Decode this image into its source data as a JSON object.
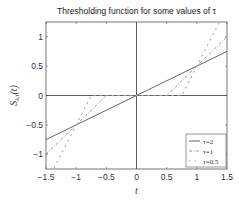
{
  "chart_data": {
    "type": "line",
    "title": "Thresholding function for some values of τ",
    "xlabel": "t",
    "ylabel": "S_{λ,τ}(t)",
    "xlim": [
      -1.5,
      1.5
    ],
    "ylim": [
      -1.25,
      1.25
    ],
    "xticks": [
      -1.5,
      -1,
      -0.5,
      0,
      0.5,
      1,
      1.5
    ],
    "xtick_labels": [
      "-1.5",
      "-1",
      "-0.5",
      "0",
      "0.5",
      "1",
      "1.5"
    ],
    "yticks": [
      -1,
      -0.5,
      0,
      0.5,
      1
    ],
    "ytick_labels": [
      "-1",
      "-0.5",
      "0",
      "0.5",
      "1"
    ],
    "grid": false,
    "legend_position": "lower right",
    "series": [
      {
        "name": "τ=2",
        "style": "solid",
        "x": [
          -1.5,
          0,
          1.5
        ],
        "y": [
          -0.75,
          0,
          0.75
        ]
      },
      {
        "name": "τ=1",
        "style": "dash-dot",
        "x": [
          -1.5,
          -0.5,
          0.5,
          1.5
        ],
        "y": [
          -1,
          0,
          0,
          1
        ]
      },
      {
        "name": "τ=0.5",
        "style": "dotted",
        "x": [
          -1.5,
          -0.75,
          0.75,
          1.5
        ],
        "y": [
          -1.5,
          0,
          0,
          1.5
        ]
      }
    ]
  },
  "legend": [
    "τ=2",
    "τ=1",
    "τ=0.5"
  ]
}
